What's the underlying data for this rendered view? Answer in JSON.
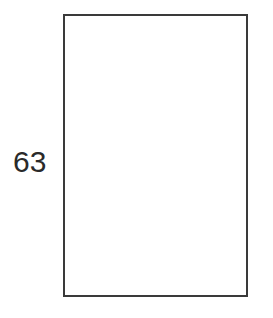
{
  "figure": {
    "type": "geometry-diagram",
    "background_color": "#ffffff",
    "width": 273,
    "height": 318
  },
  "shape": {
    "name": "rectangle",
    "stroke_color": "#3a3a3a",
    "stroke_width_px": 2,
    "fill_color": "#ffffff",
    "x": 63,
    "y": 14,
    "width": 185,
    "height": 283,
    "interior_text": ""
  },
  "labels": {
    "left_side": {
      "text": "63",
      "color": "#2a2a2a",
      "font_size_px": 30,
      "position": "left-of-rectangle-vertically-centered"
    }
  },
  "chart_data": {
    "type": "table",
    "title": "",
    "categories": [
      "left side length"
    ],
    "values": [
      63
    ],
    "annotations": [
      {
        "text": "63",
        "attached_to": "rectangle-left-side"
      }
    ],
    "xlabel": "",
    "ylabel": ""
  }
}
